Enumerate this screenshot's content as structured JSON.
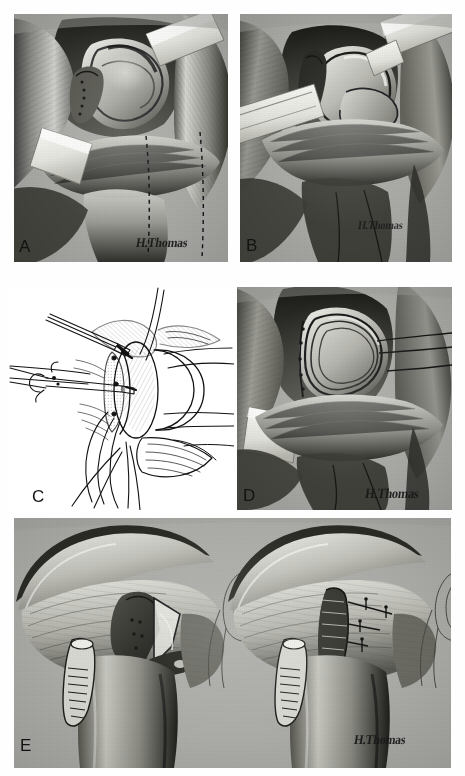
{
  "figure": {
    "kind": "surgical-illustration-plate",
    "artist_signature": "H.Thomas",
    "background_color": "#ffffff",
    "panel_background_color": "#a8a8a6",
    "ink_color": "#111111",
    "width": 465,
    "height": 776
  },
  "panels": [
    {
      "id": "A",
      "label": "A",
      "style": "tonal-wash",
      "background": "gray",
      "signature": "H.Thomas",
      "signature_visible": true,
      "subject": "deltopectoral exposure of the shoulder with two retractors and dashed incision line",
      "bounds": {
        "x": 14,
        "y": 14,
        "w": 214,
        "h": 248
      }
    },
    {
      "id": "B",
      "label": "B",
      "style": "tonal-wash",
      "background": "gray",
      "signature": "H.Thomas",
      "signature_visible": true,
      "subject": "glenohumeral joint exposed, humeral head retracted with levers",
      "bounds": {
        "x": 240,
        "y": 14,
        "w": 212,
        "h": 248
      }
    },
    {
      "id": "C",
      "label": "C",
      "style": "line-art",
      "background": "white",
      "signature": "",
      "signature_visible": false,
      "subject": "line diagram of capsular repair with suture strands, clamps and glenoid rim",
      "bounds": {
        "x": 8,
        "y": 286,
        "w": 226,
        "h": 224
      }
    },
    {
      "id": "D",
      "label": "D",
      "style": "tonal-wash",
      "background": "gray",
      "signature": "H.Thomas",
      "signature_visible": true,
      "subject": "capsulolabral repair completed, retractor in place, traction sutures drawn laterally",
      "bounds": {
        "x": 237,
        "y": 287,
        "w": 215,
        "h": 223
      }
    },
    {
      "id": "E",
      "label": "E",
      "style": "tonal-wash",
      "background": "gray",
      "signature": "H.Thomas",
      "signature_visible": true,
      "subject": "paired anterior shoulder views — subscapularis split opened (left) and repaired with mattress sutures (right), each with an inset detail of suture configuration",
      "bounds": {
        "x": 14,
        "y": 518,
        "w": 437,
        "h": 250
      },
      "sub_views": [
        {
          "id": "E-left",
          "caption": ""
        },
        {
          "id": "E-right",
          "caption": ""
        }
      ]
    }
  ],
  "labels": {
    "a": "A",
    "b": "B",
    "c": "C",
    "d": "D",
    "e": "E"
  },
  "signatures": {
    "panel_a": "H.Thomas",
    "panel_b": "H.Thomas",
    "panel_d": "H.Thomas",
    "panel_e": "H.Thomas"
  }
}
